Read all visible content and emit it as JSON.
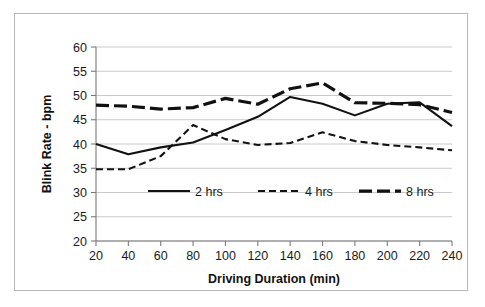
{
  "chart_data": {
    "type": "line",
    "title": "",
    "xlabel": "Driving Duration (min)",
    "ylabel": "Blink Rate - bpm",
    "x": [
      20,
      40,
      60,
      80,
      100,
      120,
      140,
      160,
      180,
      200,
      220,
      240
    ],
    "xticklabels": [
      "20",
      "40",
      "60",
      "80",
      "100",
      "120",
      "140",
      "160",
      "180",
      "200",
      "220",
      "240"
    ],
    "yticks": [
      20,
      25,
      30,
      35,
      40,
      45,
      50,
      55,
      60
    ],
    "yticklabels": [
      "20",
      "25",
      "30",
      "35",
      "40",
      "45",
      "50",
      "55",
      "60"
    ],
    "xlim": [
      20,
      240
    ],
    "ylim": [
      20,
      60
    ],
    "grid": true,
    "grid_axis": "y",
    "legend_position": "inside-center",
    "series": [
      {
        "name": "2 hrs",
        "style": "solid",
        "width": 2.1,
        "values": [
          40.0,
          37.9,
          39.3,
          40.3,
          42.9,
          45.6,
          49.7,
          48.3,
          45.9,
          48.3,
          48.6,
          43.7
        ]
      },
      {
        "name": "4 hrs",
        "style": "dashed",
        "width": 2.1,
        "values": [
          34.8,
          34.8,
          37.5,
          43.9,
          41.0,
          39.8,
          40.2,
          42.4,
          40.6,
          39.8,
          39.3,
          38.7
        ]
      },
      {
        "name": "8 hrs",
        "style": "long-dash",
        "width": 3.2,
        "values": [
          48.0,
          47.8,
          47.2,
          47.5,
          49.4,
          48.2,
          51.4,
          52.6,
          48.5,
          48.4,
          48.1,
          46.5
        ]
      }
    ]
  },
  "legend": {
    "items": [
      {
        "label": "2 hrs",
        "style": "solid"
      },
      {
        "label": "4 hrs",
        "style": "dashed"
      },
      {
        "label": "8 hrs",
        "style": "long-dash"
      }
    ]
  },
  "colors": {
    "line": "#111111",
    "grid": "#c9c9c9",
    "axis": "#7a7a7a",
    "background": "#ffffff",
    "border": "#b8b8b8"
  }
}
